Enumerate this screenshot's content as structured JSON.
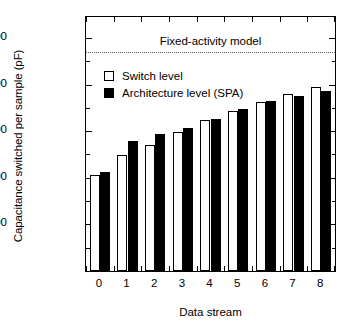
{
  "chart_data": {
    "type": "bar",
    "title": "",
    "xlabel": "Data stream",
    "ylabel": "Capacitance switched per sample (pF)",
    "categories": [
      "0",
      "1",
      "2",
      "3",
      "4",
      "5",
      "6",
      "7",
      "8"
    ],
    "series": [
      {
        "name": "Switch level",
        "color": "#ffffff",
        "values": [
          2050,
          2500,
          2700,
          2990,
          3250,
          3440,
          3620,
          3800,
          3950
        ]
      },
      {
        "name": "Architecture level (SPA)",
        "color": "#000000",
        "values": [
          2120,
          2800,
          2930,
          3060,
          3260,
          3480,
          3640,
          3750,
          3870
        ]
      }
    ],
    "ylim": [
      0,
      5450
    ],
    "ytick_values": [
      1000,
      2000,
      3000,
      4000,
      5000
    ],
    "ytick_labels": [
      "1,000",
      "2,000",
      "3,000",
      "4,000",
      "5,000"
    ],
    "yminor_step": 500,
    "grid": false,
    "legend_position": "upper left",
    "annotations": [
      {
        "name": "fixed-activity-model",
        "label": "Fixed-activity model",
        "value": 4700,
        "style": "dotted-horizontal-line",
        "color": "#555555"
      }
    ]
  },
  "legend": {
    "items": [
      {
        "label": "Switch level",
        "swatch": "hollow-square"
      },
      {
        "label": "Architecture level (SPA)",
        "swatch": "filled-square"
      }
    ]
  }
}
